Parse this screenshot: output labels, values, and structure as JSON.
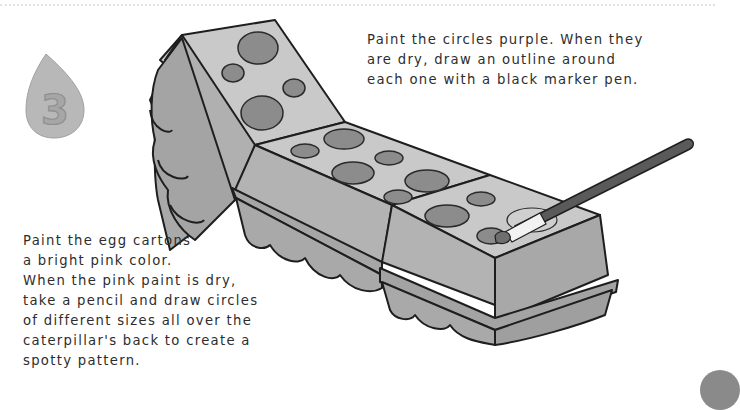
{
  "page": {
    "step_number": "3",
    "instructions": {
      "top": "Paint the circles purple. When they\nare dry, draw an outline around\neach one with a black marker pen.",
      "bottom": "Paint the egg cartons\na bright pink color.\nWhen the pink paint is dry,\ntake a pencil and draw circles\nof different sizes all over the\ncaterpillar's back to create a\nspotty pattern."
    }
  },
  "illustration": {
    "subject": "egg-carton-caterpillar-with-paintbrush",
    "colors": {
      "carton_top": "#c8c8c8",
      "carton_side": "#a8a8a8",
      "carton_shadow": "#8f8f8f",
      "spot_fill": "#8c8c8c",
      "outline": "#1e1e1e",
      "brush_handle": "#5a5a5a",
      "badge": "#b5b5b5"
    }
  }
}
